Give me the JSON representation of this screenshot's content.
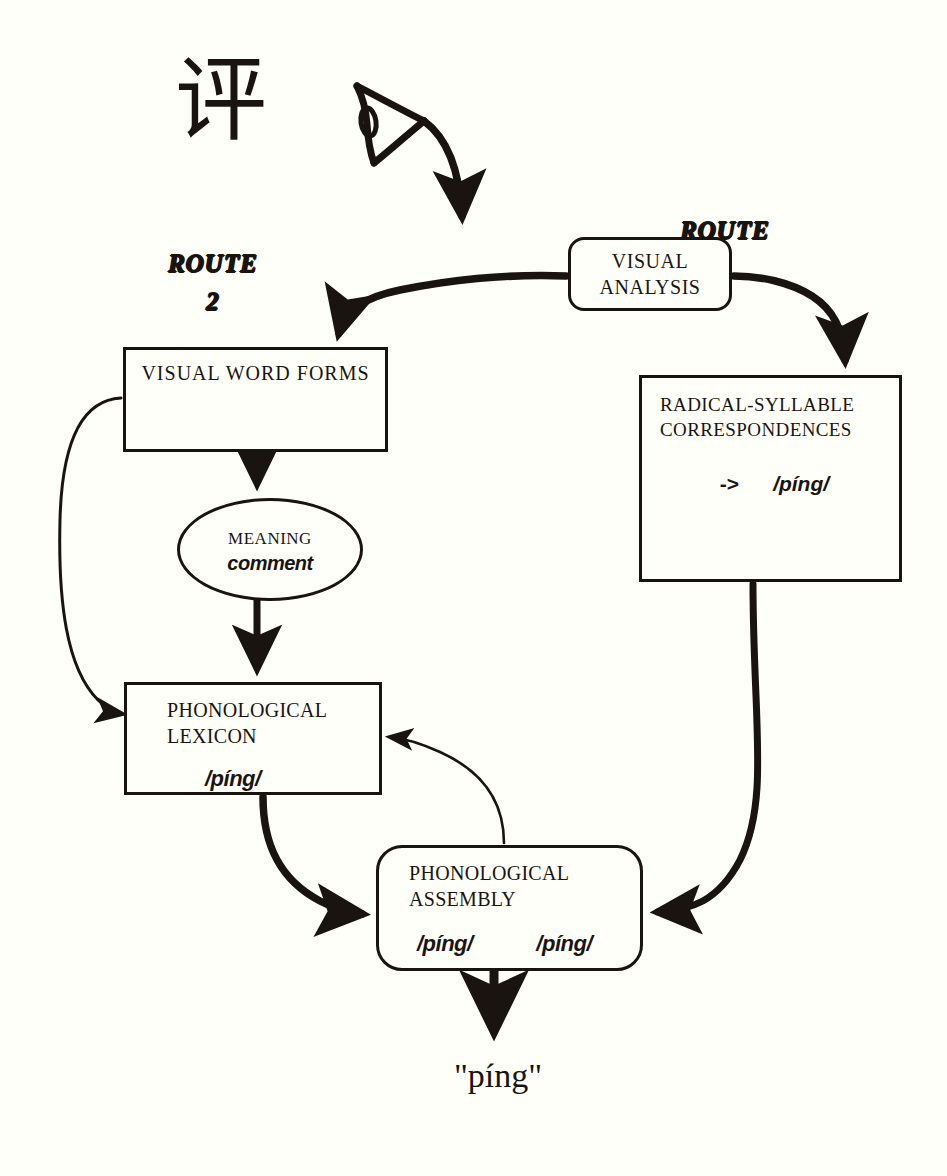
{
  "diagram": {
    "background_color": "#fffffa",
    "ink_color": "#1a1411",
    "stimulus": {
      "hanzi": "评",
      "eye_icon": "eye-icon"
    },
    "routes": [
      {
        "id": "route-2",
        "name": "ROUTE",
        "number": "2"
      },
      {
        "id": "route-1",
        "name": "ROUTE",
        "number": "1"
      }
    ],
    "nodes": {
      "visual_analysis": {
        "title": "VISUAL\nANALYSIS"
      },
      "visual_word_forms": {
        "title": "VISUAL WORD FORMS"
      },
      "radical_syllable": {
        "title": "RADICAL-SYLLABLE\nCORRESPONDENCES",
        "arrow": "->",
        "syllable": "/píng/"
      },
      "meaning": {
        "title": "MEANING",
        "gloss": "comment"
      },
      "phonological_lexicon": {
        "title": "PHONOLOGICAL\nLEXICON",
        "syllable": "/píng/"
      },
      "phonological_assembly": {
        "title": "PHONOLOGICAL\nASSEMBLY",
        "syllable_left": "/píng/",
        "syllable_right": "/píng/"
      }
    },
    "output": {
      "spoken": "\"píng\""
    }
  }
}
